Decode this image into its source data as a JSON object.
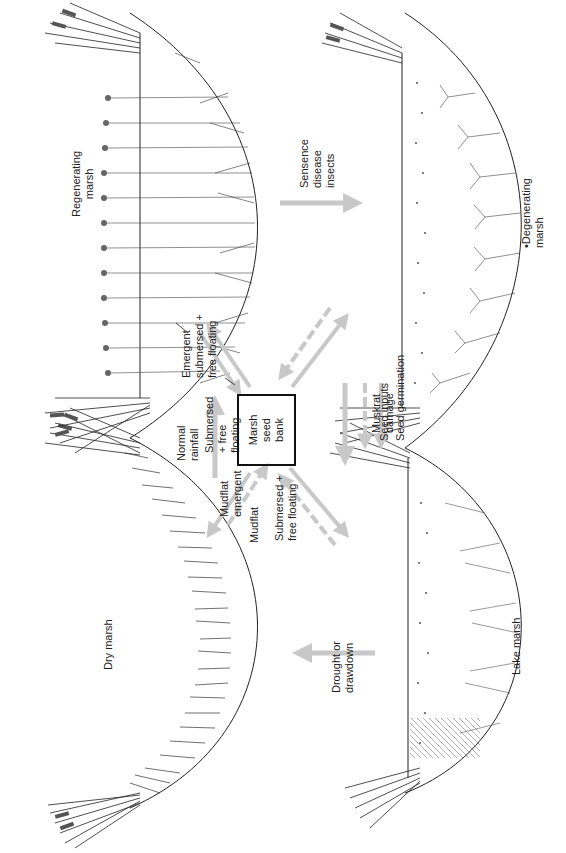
{
  "diagram": {
    "title_orientation": "rotated 90 degrees counterclockwise",
    "center": {
      "label": "Marsh\nseed\nbank"
    },
    "stages": [
      {
        "id": "dry",
        "label": "Dry marsh"
      },
      {
        "id": "regenerating",
        "label": "Regenerating\nmarsh"
      },
      {
        "id": "degenerating",
        "label": "•Degenerating\nmarsh"
      },
      {
        "id": "lake",
        "label": "Lake marsh"
      }
    ],
    "transitions": [
      {
        "from": "lake",
        "to": "dry",
        "label": "Drought or\ndrawdown"
      },
      {
        "from": "dry",
        "to": "regenerating",
        "label": "Normal\nrainfall"
      },
      {
        "from": "regenerating",
        "to": "degenerating",
        "label": "Sensence\ndisease\ninsects"
      },
      {
        "from": "degenerating",
        "to": "lake",
        "label": "Muskrat\ndamage"
      }
    ],
    "seed_flows": [
      {
        "stage": "dry",
        "label": "Mudflat\nemergent"
      },
      {
        "stage": "dry",
        "label": "Mudflat"
      },
      {
        "stage": "regenerating",
        "label": "Submersed\n+ free\nfloating"
      },
      {
        "stage": "regenerating",
        "label": "Emergent\nsubmersed +\nfree floating"
      },
      {
        "stage": "lake",
        "label": "Submersed +\nfree floating"
      }
    ],
    "legend": [
      {
        "style": "dashed-arrow",
        "label": "Seed inputs"
      },
      {
        "style": "solid-arrow",
        "label": "Seed germination"
      }
    ],
    "colors": {
      "arrow": "#c8c8c8",
      "line": "#222222",
      "background": "#ffffff"
    }
  }
}
